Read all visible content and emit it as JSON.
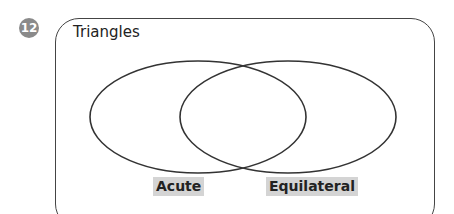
{
  "problem_number": "12",
  "diagram": {
    "title": "Triangles",
    "circles": [
      {
        "label": "Acute"
      },
      {
        "label": "Equilateral"
      }
    ]
  }
}
